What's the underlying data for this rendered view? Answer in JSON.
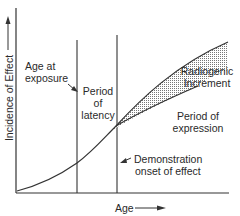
{
  "diagram": {
    "y_axis_label": "Incidence of Effect",
    "x_axis_label": "Age",
    "labels": {
      "age_at_exposure_line1": "Age at",
      "age_at_exposure_line2": "exposure",
      "period_latency_line1": "Period",
      "period_latency_line2": "of",
      "period_latency_line3": "latency",
      "radiogenic_line1": "Radiogenic",
      "radiogenic_line2": "Increment",
      "period_expression_line1": "Period of",
      "period_expression_line2": "expression",
      "demonstration_line1": "Demonstration",
      "demonstration_line2": "onset of effect"
    },
    "colors": {
      "line": "#333333",
      "shade": "#9a9a9a",
      "background": "#ffffff"
    }
  }
}
